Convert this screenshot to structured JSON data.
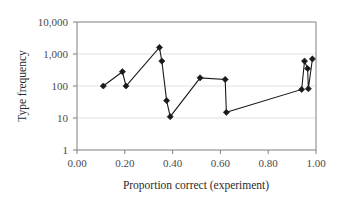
{
  "chart_data": {
    "type": "line",
    "title": "",
    "xlabel": "Proportion correct (experiment)",
    "ylabel": "Type frequency",
    "xlim": [
      0.0,
      1.0
    ],
    "ylim": [
      1,
      10000
    ],
    "yscale": "log",
    "grid": "horizontal",
    "legend": "none",
    "marker": "diamond",
    "x_ticks": [
      "0.00",
      "0.20",
      "0.40",
      "0.60",
      "0.80",
      "1.00"
    ],
    "x_tick_values": [
      0.0,
      0.2,
      0.4,
      0.6,
      0.8,
      1.0
    ],
    "y_ticks": [
      "1",
      "10",
      "100",
      "1,000",
      "10,000"
    ],
    "y_tick_values": [
      1,
      10,
      100,
      1000,
      10000
    ],
    "series": [
      {
        "name": "Type frequency vs proportion correct",
        "points": [
          {
            "x": 0.11,
            "y": 100
          },
          {
            "x": 0.19,
            "y": 280
          },
          {
            "x": 0.205,
            "y": 100
          },
          {
            "x": 0.345,
            "y": 1600
          },
          {
            "x": 0.355,
            "y": 600
          },
          {
            "x": 0.375,
            "y": 35
          },
          {
            "x": 0.39,
            "y": 11
          },
          {
            "x": 0.515,
            "y": 180
          },
          {
            "x": 0.62,
            "y": 160
          },
          {
            "x": 0.625,
            "y": 15
          },
          {
            "x": 0.94,
            "y": 78
          },
          {
            "x": 0.952,
            "y": 600
          },
          {
            "x": 0.965,
            "y": 350
          },
          {
            "x": 0.968,
            "y": 82
          },
          {
            "x": 0.985,
            "y": 700
          }
        ]
      }
    ]
  },
  "colors": {
    "marker": "#1a1a1a",
    "line": "#1a1a1a",
    "grid": "#d9d9d9",
    "frame": "#808080",
    "text": "#2b2b2b",
    "background": "#ffffff"
  }
}
